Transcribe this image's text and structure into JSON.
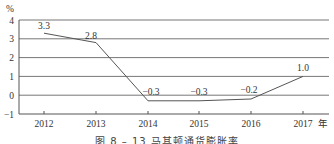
{
  "chart_data": {
    "type": "line",
    "title": "",
    "caption": "图 8 – 13  马其顿通货膨胀率",
    "xlabel": "年",
    "ylabel": "%",
    "categories": [
      "2012",
      "2013",
      "2014",
      "2015",
      "2016",
      "2017"
    ],
    "series": [
      {
        "name": "通货膨胀率",
        "values": [
          3.3,
          2.8,
          -0.3,
          -0.3,
          -0.2,
          1.0
        ]
      }
    ],
    "data_labels": [
      "3.3",
      "2.8",
      "−0.3",
      "−0.3",
      "−0.2",
      "1.0"
    ],
    "yticks": [
      "4",
      "3",
      "2",
      "1",
      "0",
      "−1"
    ],
    "ylim": [
      -1,
      4
    ],
    "grid": "horizontal",
    "legend": "none"
  },
  "colors": {
    "line": "#555555",
    "grid": "#777777",
    "axis": "#555555"
  }
}
